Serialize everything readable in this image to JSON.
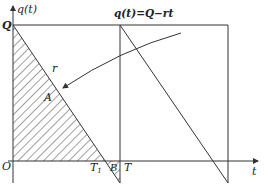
{
  "diagram": {
    "y_axis_label": "q(t)",
    "x_axis_label": "t",
    "origin_label": "O",
    "q_label": "Q",
    "formula_label": "q(t)=Q−rt",
    "rate_label": "r",
    "region_a_label": "A",
    "region_b_label": "B",
    "t1_label": "T",
    "t1_subscript": "1",
    "t_label": "T",
    "colors": {
      "stroke": "#333333",
      "hatch": "#444444",
      "background": "#ffffff"
    }
  }
}
